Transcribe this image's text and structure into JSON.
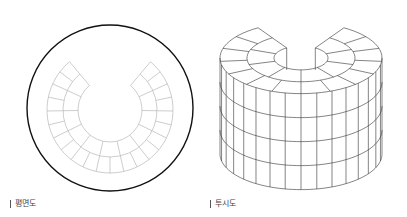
{
  "figures": [
    {
      "id": "plan",
      "caption": "평면도",
      "caption_pos": {
        "x": 10,
        "y": 200
      },
      "outer_circle": {
        "cx": 110,
        "cy": 108,
        "r": 83,
        "stroke": "#111111",
        "width": 1.4
      },
      "ring": {
        "cx": 110,
        "cy": 110,
        "radii": [
          32,
          47,
          63
        ],
        "gap_half_angle_deg": 40,
        "segments_per_band": [
          11,
          22
        ],
        "stroke": "#b8b8b8",
        "width": 0.7
      }
    },
    {
      "id": "perspective",
      "caption": "투시도",
      "caption_pos": {
        "x": 210,
        "y": 200
      },
      "cylinder": {
        "cx": 301,
        "top_cy": 58,
        "yscale": 0.44,
        "radii": [
          27,
          54,
          81
        ],
        "gap_half_angle_deg": 32,
        "segments_per_band": [
          8,
          14
        ],
        "wall_segments": 16,
        "layers": 4,
        "layer_height": 24,
        "stroke": "#333333",
        "width": 0.6
      }
    }
  ]
}
